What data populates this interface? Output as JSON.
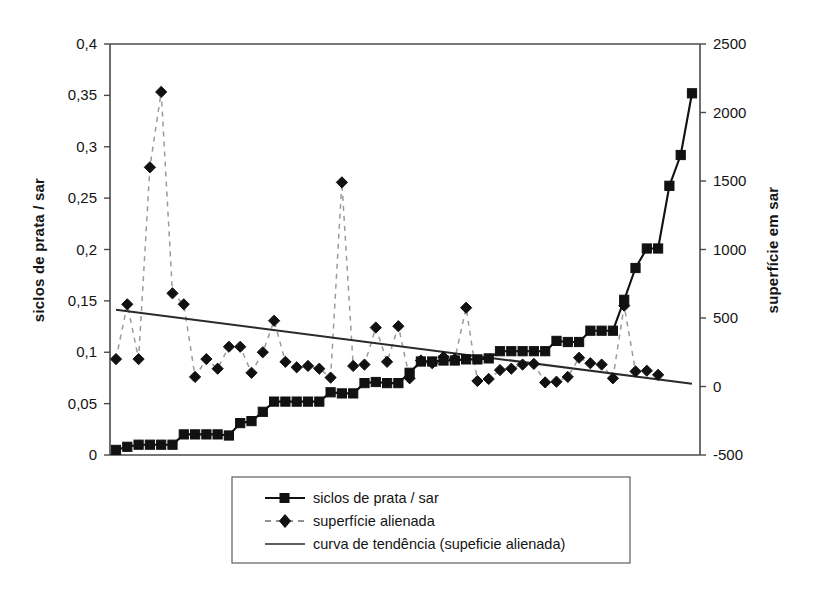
{
  "chart_data": {
    "type": "line",
    "title": "",
    "subtitle": "",
    "xlabel": "",
    "ylabel": "siclos de prata / sar",
    "y2label": "superfície em sar",
    "ylim": [
      0,
      0.4
    ],
    "y2lim": [
      -500,
      2500
    ],
    "grid": false,
    "legend_position": "bottom",
    "decimal_separator": ",",
    "y_ticks": [
      "0",
      "0,05",
      "0,1",
      "0,15",
      "0,2",
      "0,25",
      "0,3",
      "0,35",
      "0,4"
    ],
    "y_tick_values": [
      0,
      0.05,
      0.1,
      0.15,
      0.2,
      0.25,
      0.3,
      0.35,
      0.4
    ],
    "y2_ticks": [
      "-500",
      "0",
      "500",
      "1000",
      "1500",
      "2000",
      "2500"
    ],
    "y2_tick_values": [
      -500,
      0,
      500,
      1000,
      1500,
      2000,
      2500
    ],
    "x_ticks": [],
    "n_points": 49,
    "series": [
      {
        "name": "siclos de prata / sar",
        "axis": "left",
        "marker": "square",
        "line_style": "solid",
        "color": "#111111",
        "values": [
          0.005,
          0.008,
          0.01,
          0.01,
          0.01,
          0.01,
          0.02,
          0.02,
          0.02,
          0.02,
          0.019,
          0.031,
          0.033,
          0.042,
          0.052,
          0.052,
          0.052,
          0.052,
          0.052,
          0.061,
          0.06,
          0.06,
          0.07,
          0.071,
          0.07,
          0.07,
          0.08,
          0.091,
          0.091,
          0.092,
          0.092,
          0.093,
          0.093,
          0.094,
          0.101,
          0.101,
          0.101,
          0.101,
          0.101,
          0.111,
          0.11,
          0.11,
          0.121,
          0.121,
          0.121,
          0.151,
          0.182,
          0.201,
          0.201,
          0.262,
          0.292,
          0.352
        ]
      },
      {
        "name": "superfície alienada",
        "axis": "right",
        "marker": "diamond",
        "line_style": "dashed",
        "color": "#111111",
        "values": [
          200,
          600,
          200,
          1600,
          2150,
          680,
          600,
          70,
          200,
          130,
          290,
          290,
          100,
          250,
          480,
          180,
          140,
          150,
          130,
          65,
          1490,
          150,
          160,
          430,
          180,
          440,
          60,
          190,
          170,
          215,
          200,
          575,
          40,
          55,
          120,
          130,
          160,
          165,
          30,
          35,
          70,
          210,
          170,
          160,
          60,
          590,
          110,
          115,
          85
        ]
      }
    ],
    "trend": {
      "name": "curva de tendência (supeficie alienada)",
      "axis": "right",
      "line_style": "solid",
      "color": "#2a2a2a",
      "start_value": 560,
      "end_value": 20
    },
    "legend": [
      {
        "label": "siclos de prata / sar",
        "marker": "square",
        "line_style": "solid"
      },
      {
        "label": "superfície alienada",
        "marker": "diamond",
        "line_style": "dashed"
      },
      {
        "label": "curva de tendência (supeficie alienada)",
        "marker": "none",
        "line_style": "solid"
      }
    ]
  }
}
